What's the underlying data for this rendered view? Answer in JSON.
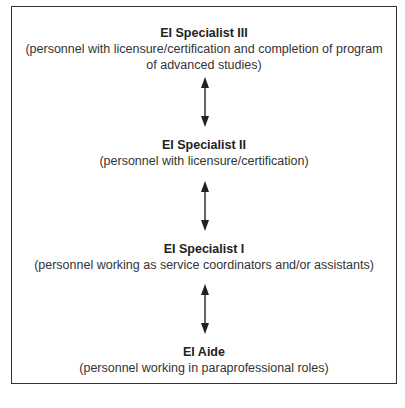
{
  "diagram": {
    "type": "vertical-hierarchy",
    "levels": [
      {
        "title": "EI Specialist III",
        "description_lines": [
          "(personnel with licensure/certification and completion of program",
          "of advanced studies)"
        ]
      },
      {
        "title": "EI Specialist II",
        "description_lines": [
          "(personnel with licensure/certification)"
        ]
      },
      {
        "title": "EI Specialist I",
        "description_lines": [
          "(personnel working as service coordinators and/or assistants)"
        ]
      },
      {
        "title": "EI Aide",
        "description_lines": [
          "(personnel working in paraprofessional roles)"
        ]
      }
    ],
    "connectors": [
      {
        "from": "EI Specialist III",
        "to": "EI Specialist II",
        "style": "double-headed-arrow"
      },
      {
        "from": "EI Specialist II",
        "to": "EI Specialist I",
        "style": "double-headed-arrow"
      },
      {
        "from": "EI Specialist I",
        "to": "EI Aide",
        "style": "double-headed-arrow"
      }
    ]
  }
}
